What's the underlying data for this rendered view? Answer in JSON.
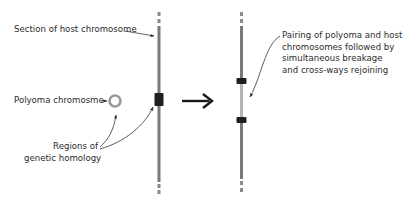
{
  "labels": {
    "host_section": "Section of host chromosome",
    "polyoma": "Polyoma chromosme",
    "regions_line1": "Regions of",
    "regions_line2": "genetic homology",
    "pairing_line1": "Pairing of polyoma and host",
    "pairing_line2": "chromosomes followed by",
    "pairing_line3": "simultaneous breakage",
    "pairing_line4": "and cross-ways rejoining"
  },
  "colors": {
    "chromosome": "#7a7a7a",
    "inserted_segment": "#b4b4b4",
    "homology_band": "#1e1e1e",
    "polyoma_ring": "#9a9a9a",
    "arrow": "#1a1a1a",
    "text": "#2b2b2b"
  }
}
